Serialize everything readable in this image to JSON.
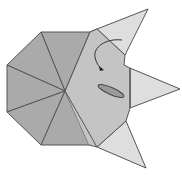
{
  "diagram": {
    "colors": {
      "dark_triangle": "#aaaaaa",
      "face": "#c4c4c4",
      "flap": "#dedede",
      "stroke": "#555555",
      "slot": "#9a9a9a",
      "background": "#ffffff"
    },
    "center_point": [
      65,
      91
    ],
    "fan_triangles": 8,
    "flaps": 3,
    "annotations": [
      "curved-fold-arrow",
      "elliptical-slot"
    ]
  }
}
